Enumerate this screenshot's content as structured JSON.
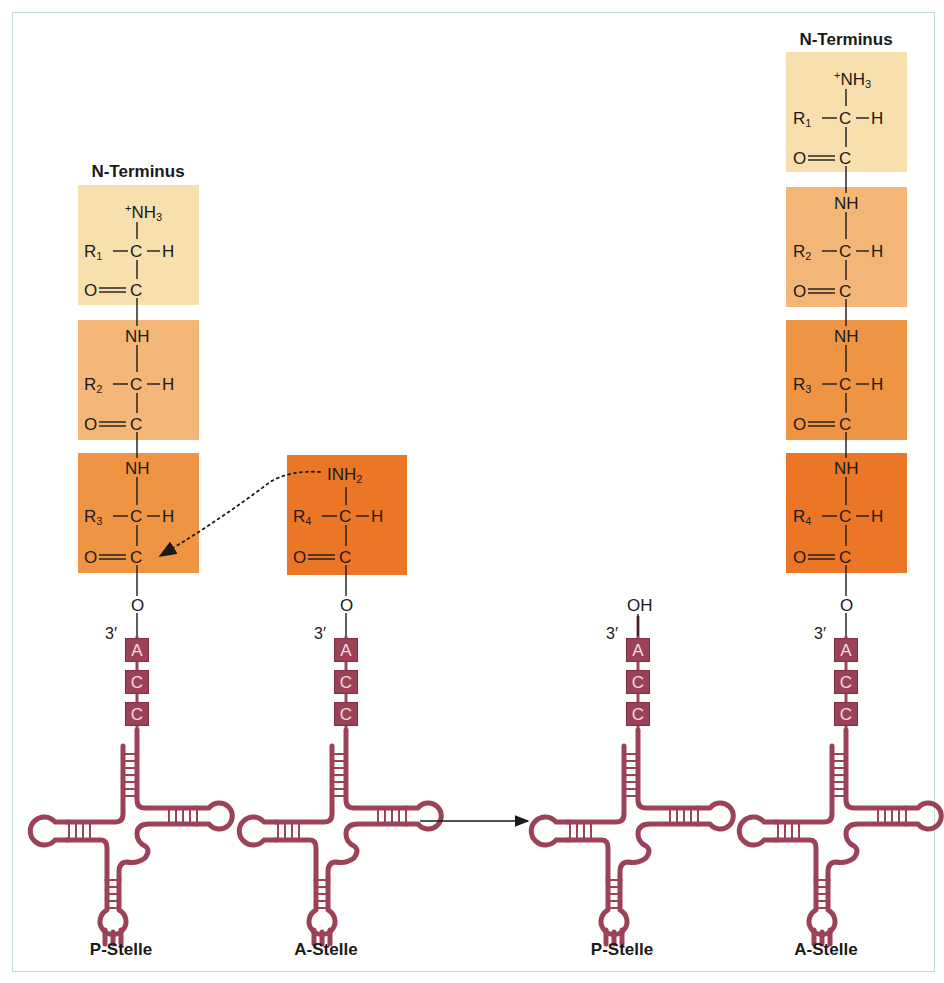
{
  "colors": {
    "box_1": "#f8dfae",
    "box_2": "#f3b676",
    "box_3": "#ef9443",
    "box_4": "#ea7626",
    "trna": "#9b4258",
    "frame_border": "#bfd9dc",
    "text": "#1a1a1a"
  },
  "labels": {
    "n_terminus": "N-Terminus",
    "p_site": "P-Stelle",
    "a_site": "A-Stelle",
    "three_prime": "3′",
    "nucleotides": [
      "A",
      "C",
      "C"
    ]
  },
  "before": {
    "p_site": {
      "label": "P-Stelle",
      "n_terminus_label": "N-Terminus",
      "residues": [
        {
          "top": "+NH3",
          "r": "R1",
          "bottom": "O=C"
        },
        {
          "top": "NH",
          "r": "R2",
          "bottom": "O=C"
        },
        {
          "top": "NH",
          "r": "R3",
          "bottom": "O=C"
        }
      ],
      "linker": "O",
      "acc": [
        "A",
        "C",
        "C"
      ]
    },
    "a_site": {
      "label": "A-Stelle",
      "residues": [
        {
          "top": "NH2",
          "r": "R4",
          "bottom": "O=C"
        }
      ],
      "linker": "O",
      "acc": [
        "A",
        "C",
        "C"
      ]
    },
    "attack_arrow": "dotted nucleophilic attack from NH2 of R4 residue to carbonyl C of R3 residue"
  },
  "reaction_arrow": "→",
  "after": {
    "p_site": {
      "label": "P-Stelle",
      "terminal_group": "OH",
      "acc": [
        "A",
        "C",
        "C"
      ]
    },
    "a_site": {
      "label": "A-Stelle",
      "n_terminus_label": "N-Terminus",
      "residues": [
        {
          "top": "+NH3",
          "r": "R1",
          "bottom": "O=C"
        },
        {
          "top": "NH",
          "r": "R2",
          "bottom": "O=C"
        },
        {
          "top": "NH",
          "r": "R3",
          "bottom": "O=C"
        },
        {
          "top": "NH",
          "r": "R4",
          "bottom": "O=C"
        }
      ],
      "linker": "O",
      "acc": [
        "A",
        "C",
        "C"
      ]
    }
  }
}
